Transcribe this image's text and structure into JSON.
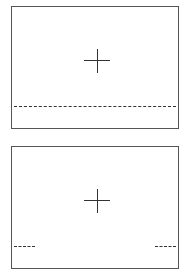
{
  "diagram": {
    "panels": [
      {
        "id": "top",
        "marker": "crosshair",
        "guide_line": "full-width dashed horizontal line"
      },
      {
        "id": "bottom",
        "marker": "crosshair",
        "guide_line": "short dashed segments at left and right edges"
      }
    ],
    "colors": {
      "border": "#555555",
      "stroke": "#333333",
      "background": "#ffffff"
    }
  }
}
